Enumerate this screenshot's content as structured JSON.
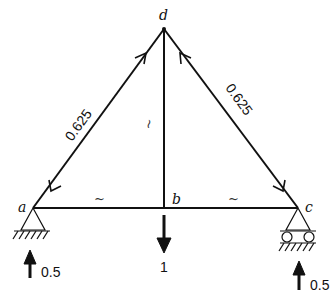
{
  "diagram": {
    "type": "truss",
    "nodes": {
      "a": {
        "label": "a"
      },
      "b": {
        "label": "b"
      },
      "c": {
        "label": "c"
      },
      "d": {
        "label": "d"
      }
    },
    "members": [
      {
        "id": "ad",
        "from": "a",
        "to": "d",
        "force_label": "0.625"
      },
      {
        "id": "cd",
        "from": "c",
        "to": "d",
        "force_label": "0.625"
      },
      {
        "id": "bd",
        "from": "b",
        "to": "d",
        "force_label": "~"
      },
      {
        "id": "ab",
        "from": "a",
        "to": "b",
        "force_label": "~"
      },
      {
        "id": "bc",
        "from": "b",
        "to": "c",
        "force_label": "~"
      }
    ],
    "supports": [
      {
        "node": "a",
        "type": "pin"
      },
      {
        "node": "c",
        "type": "roller"
      }
    ],
    "loads": [
      {
        "node": "b",
        "direction": "down",
        "label": "1"
      }
    ],
    "reactions": [
      {
        "node": "a",
        "direction": "up",
        "label": "0.5"
      },
      {
        "node": "c",
        "direction": "up",
        "label": "0.5"
      }
    ]
  }
}
